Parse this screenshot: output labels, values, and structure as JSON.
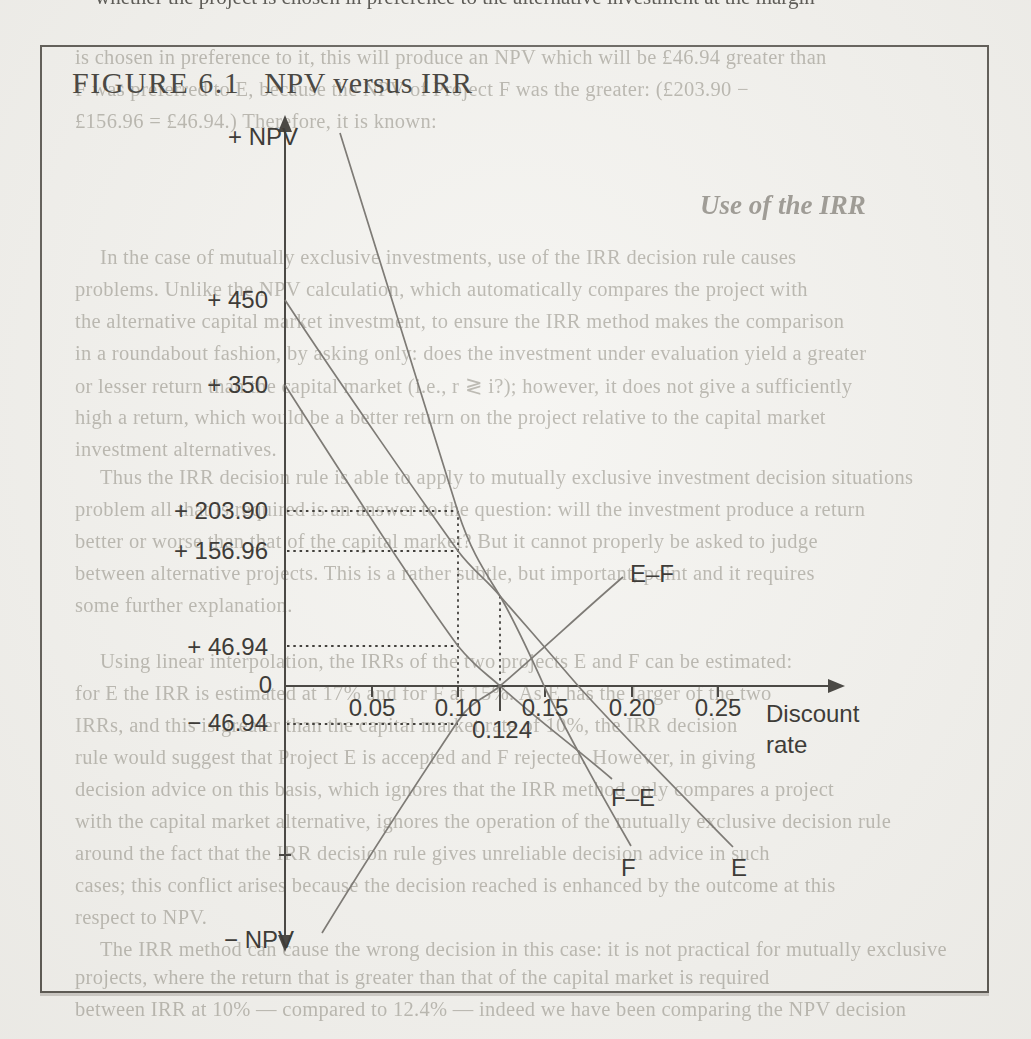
{
  "figure": {
    "label": "FIGURE 6.1",
    "title": "NPV versus IRR"
  },
  "chart_data": {
    "type": "line",
    "title": "NPV versus IRR",
    "xlabel": "Discount rate",
    "ylabel_positive": "+ NPV",
    "ylabel_negative": "− NPV",
    "x_ticks": [
      0.05,
      0.1,
      0.15,
      0.2,
      0.25
    ],
    "x_special_tick": 0.124,
    "y_labeled_values": [
      450,
      350,
      203.9,
      156.96,
      46.94,
      0,
      -46.94
    ],
    "xlim": [
      0,
      0.32
    ],
    "ylim": [
      -300,
      520
    ],
    "grid": false,
    "legend_position": "labels at line ends",
    "series": [
      {
        "name": "F",
        "points": [
          [
            0.032,
            645
          ],
          [
            0.1,
            203.9
          ],
          [
            0.124,
            105
          ],
          [
            0.15,
            0
          ],
          [
            0.2,
            -187
          ]
        ]
      },
      {
        "name": "E",
        "points": [
          [
            0.0,
            450
          ],
          [
            0.1,
            156.96
          ],
          [
            0.124,
            105
          ],
          [
            0.17,
            0
          ],
          [
            0.258,
            -188
          ]
        ]
      },
      {
        "name": "F–E",
        "points": [
          [
            0.0,
            350
          ],
          [
            0.1,
            46.94
          ],
          [
            0.124,
            0
          ],
          [
            0.189,
            -108
          ]
        ]
      },
      {
        "name": "E–F",
        "points": [
          [
            0.021,
            -288
          ],
          [
            0.1,
            -46.94
          ],
          [
            0.124,
            0
          ],
          [
            0.195,
            127
          ]
        ]
      }
    ],
    "annotations": {
      "crossover_rate": 0.124,
      "npv_at_0.10": {
        "F": 203.9,
        "E": 156.96,
        "F−E": 46.94,
        "E−F": -46.94
      },
      "dotted_guides_horizontal": [
        203.9,
        156.96,
        46.94,
        -46.94
      ],
      "dotted_guides_vertical": [
        0.1,
        0.124
      ]
    }
  },
  "axis": {
    "y_positive_label": "+ NPV",
    "y_negative_label": "− NPV",
    "x_label_display": "Discount\nrate",
    "special_tick_label": "0.124"
  },
  "y_labels": [
    {
      "text": "+ 450",
      "x": 118,
      "y": 286
    },
    {
      "text": "+ 350",
      "x": 118,
      "y": 371
    },
    {
      "text": "+ 203.90",
      "x": 118,
      "y": 497
    },
    {
      "text": "+ 156.96",
      "x": 118,
      "y": 537
    },
    {
      "text": "+ 46.94",
      "x": 118,
      "y": 633
    },
    {
      "text": "0",
      "x": 122,
      "y": 671
    },
    {
      "text": "− 46.94",
      "x": 118,
      "y": 709
    }
  ],
  "x_labels": [
    {
      "text": "0.05",
      "x": 327,
      "y": 694
    },
    {
      "text": "0.10",
      "x": 413,
      "y": 694
    },
    {
      "text": "0.15",
      "x": 500,
      "y": 694
    },
    {
      "text": "0.20",
      "x": 587,
      "y": 694
    },
    {
      "text": "0.25",
      "x": 673,
      "y": 694
    },
    {
      "text": "0.124",
      "x": 457,
      "y": 716
    }
  ],
  "curve_labels": [
    {
      "text": "E–F",
      "x": 630,
      "y": 560
    },
    {
      "text": "F–E",
      "x": 611,
      "y": 784
    },
    {
      "text": "F",
      "x": 621,
      "y": 854
    },
    {
      "text": "E",
      "x": 731,
      "y": 854
    }
  ],
  "bleed": {
    "heading": {
      "text": "Use of the IRR",
      "x": 700,
      "y": 190
    },
    "top_cropped_line": "whether the project is chosen in preference to the alternative investment at the margin",
    "lines": [
      {
        "text": "is chosen in preference to it, this will produce an NPV which will be £46.94 greater than",
        "x": 75,
        "y": 46
      },
      {
        "text": "F was preferred to E, because the NPV of Project F was the greater: (£203.90 −",
        "x": 75,
        "y": 78
      },
      {
        "text": "£156.96 = £46.94.) Therefore, it is known:",
        "x": 75,
        "y": 110
      },
      {
        "text": "In the case of mutually exclusive investments, use of the IRR decision rule causes",
        "x": 100,
        "y": 246
      },
      {
        "text": "problems. Unlike the NPV calculation, which automatically compares the project with",
        "x": 75,
        "y": 278
      },
      {
        "text": "the alternative capital market investment, to ensure the IRR method makes the comparison",
        "x": 75,
        "y": 310
      },
      {
        "text": "in a roundabout fashion, by asking only: does the investment under evaluation yield a greater",
        "x": 75,
        "y": 342
      },
      {
        "text": "or lesser return than the capital market (i.e., r ≷ i?); however, it does not give a sufficiently",
        "x": 75,
        "y": 374
      },
      {
        "text": "high a return, which would be a better return on the project relative to the capital market",
        "x": 75,
        "y": 406
      },
      {
        "text": "investment alternatives.",
        "x": 75,
        "y": 438
      },
      {
        "text": "Thus the IRR decision rule is able to apply to mutually exclusive investment decision situations",
        "x": 100,
        "y": 466
      },
      {
        "text": "problem all that is required is an answer to the question: will the investment produce a return",
        "x": 75,
        "y": 498
      },
      {
        "text": "better or worse than that of the capital market? But it cannot properly be asked to judge",
        "x": 75,
        "y": 530
      },
      {
        "text": "between alternative projects. This is a rather subtle, but important, point and it requires",
        "x": 75,
        "y": 562
      },
      {
        "text": "some further explanation.",
        "x": 75,
        "y": 594
      },
      {
        "text": "Using linear interpolation, the IRRs of the two projects E and F can be estimated:",
        "x": 100,
        "y": 650
      },
      {
        "text": "for E the IRR is estimated at 17% and for F at 15%. As E has the larger of the two",
        "x": 75,
        "y": 682
      },
      {
        "text": "IRRs, and this is greater than the capital market rate of 10%, the IRR decision",
        "x": 75,
        "y": 714
      },
      {
        "text": "rule would suggest that Project E is accepted and F rejected. However, in giving",
        "x": 75,
        "y": 746
      },
      {
        "text": "decision advice on this basis, which ignores that the IRR method only compares a project",
        "x": 75,
        "y": 778
      },
      {
        "text": "with the capital market alternative, ignores the operation of the mutually exclusive decision rule",
        "x": 75,
        "y": 810
      },
      {
        "text": "around the fact that the IRR decision rule gives unreliable decision advice in such",
        "x": 75,
        "y": 842
      },
      {
        "text": "cases; this conflict arises because the decision reached is enhanced by the outcome at this",
        "x": 75,
        "y": 874
      },
      {
        "text": "respect to NPV.",
        "x": 75,
        "y": 906
      },
      {
        "text": "The IRR method can cause the wrong decision in this case: it is not practical for mutually exclusive",
        "x": 100,
        "y": 938
      },
      {
        "text": "projects, where the return that is greater than that of the capital market is required",
        "x": 75,
        "y": 966
      },
      {
        "text": "between IRR at 10% — compared to 12.4% — indeed we have been comparing the NPV decision",
        "x": 75,
        "y": 998
      }
    ]
  }
}
